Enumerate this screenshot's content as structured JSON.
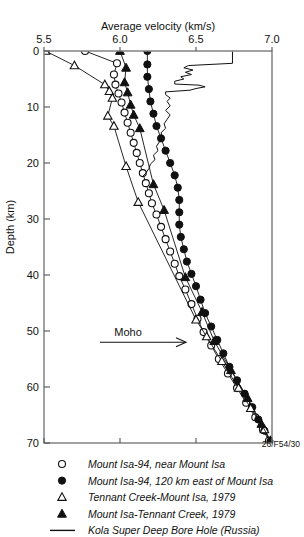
{
  "figure": {
    "code_label": "26/F54/30",
    "annotation": {
      "text": "Moho",
      "depth_km": 52
    }
  },
  "chart_data": {
    "type": "line",
    "title": "Average velocity (km/s)",
    "xlabel": "Average velocity (km/s)",
    "ylabel": "Depth (km)",
    "xlim": [
      5.5,
      7.0
    ],
    "ylim": [
      0,
      70
    ],
    "y_inverted": true,
    "xticks": [
      5.5,
      6.0,
      6.5,
      7.0
    ],
    "xtick_labels": [
      "5.5",
      "6.0",
      "6.5",
      "7.0"
    ],
    "yticks": [
      0,
      10,
      20,
      30,
      40,
      50,
      60,
      70
    ],
    "ytick_labels": [
      "0",
      "10",
      "20",
      "30",
      "40",
      "50",
      "60",
      "70"
    ],
    "grid": false,
    "legend_position": "below",
    "series": [
      {
        "name": "Mount Isa-94, near Mount Isa",
        "marker": "open-circle",
        "points": [
          [
            5.77,
            0.0
          ],
          [
            5.98,
            2.2
          ],
          [
            5.96,
            4.2
          ],
          [
            5.97,
            6.0
          ],
          [
            5.99,
            7.6
          ],
          [
            6.01,
            9.2
          ],
          [
            6.03,
            11.0
          ],
          [
            6.05,
            12.8
          ],
          [
            6.07,
            14.6
          ],
          [
            6.09,
            16.4
          ],
          [
            6.11,
            18.2
          ],
          [
            6.13,
            20.0
          ],
          [
            6.15,
            21.8
          ],
          [
            6.17,
            23.6
          ],
          [
            6.19,
            25.4
          ],
          [
            6.21,
            27.2
          ],
          [
            6.24,
            29.2
          ],
          [
            6.27,
            31.4
          ],
          [
            6.3,
            33.6
          ],
          [
            6.33,
            35.8
          ],
          [
            6.36,
            38.0
          ],
          [
            6.39,
            40.2
          ],
          [
            6.43,
            42.6
          ],
          [
            6.47,
            45.2
          ],
          [
            6.51,
            47.8
          ],
          [
            6.55,
            50.2
          ],
          [
            6.6,
            52.6
          ],
          [
            6.65,
            55.0
          ],
          [
            6.71,
            57.6
          ],
          [
            6.77,
            60.2
          ],
          [
            6.83,
            62.8
          ],
          [
            6.89,
            65.4
          ],
          [
            6.94,
            67.6
          ],
          [
            6.98,
            69.6
          ]
        ]
      },
      {
        "name": "Mount Isa-94, 120 km east of Mount Isa",
        "marker": "filled-circle",
        "points": [
          [
            6.18,
            0.0
          ],
          [
            6.18,
            2.4
          ],
          [
            6.18,
            4.6
          ],
          [
            6.19,
            6.8
          ],
          [
            6.2,
            9.0
          ],
          [
            6.22,
            11.2
          ],
          [
            6.24,
            13.4
          ],
          [
            6.27,
            15.6
          ],
          [
            6.3,
            17.8
          ],
          [
            6.33,
            20.0
          ],
          [
            6.36,
            22.2
          ],
          [
            6.38,
            24.4
          ],
          [
            6.39,
            26.6
          ],
          [
            6.39,
            28.8
          ],
          [
            6.39,
            31.0
          ],
          [
            6.4,
            33.2
          ],
          [
            6.42,
            35.4
          ],
          [
            6.44,
            37.6
          ],
          [
            6.47,
            39.8
          ],
          [
            6.5,
            42.0
          ],
          [
            6.53,
            44.4
          ],
          [
            6.56,
            46.8
          ],
          [
            6.6,
            49.2
          ],
          [
            6.64,
            51.6
          ],
          [
            6.68,
            54.0
          ],
          [
            6.72,
            56.4
          ],
          [
            6.77,
            58.8
          ],
          [
            6.82,
            61.2
          ],
          [
            6.87,
            63.6
          ],
          [
            6.91,
            65.8
          ],
          [
            6.95,
            67.8
          ],
          [
            6.99,
            69.7
          ]
        ]
      },
      {
        "name": "Tennant Creek-Mount Isa, 1979",
        "marker": "open-triangle",
        "points": [
          [
            5.51,
            0.0
          ],
          [
            5.7,
            2.6
          ],
          [
            5.9,
            6.0
          ],
          [
            5.93,
            7.2
          ],
          [
            5.95,
            8.4
          ],
          [
            5.92,
            11.6
          ],
          [
            5.96,
            13.4
          ],
          [
            6.04,
            20.6
          ],
          [
            6.12,
            27.0
          ],
          [
            6.5,
            48.0
          ],
          [
            6.57,
            51.0
          ],
          [
            6.67,
            55.4
          ],
          [
            6.78,
            60.2
          ],
          [
            6.86,
            63.8
          ],
          [
            6.95,
            67.6
          ],
          [
            6.99,
            69.6
          ]
        ]
      },
      {
        "name": "Mount Isa-Tennant Creek, 1979",
        "marker": "filled-triangle",
        "points": [
          [
            6.0,
            0.0
          ],
          [
            6.04,
            3.0
          ],
          [
            6.03,
            5.6
          ],
          [
            6.05,
            7.4
          ],
          [
            6.07,
            9.6
          ],
          [
            6.09,
            11.4
          ],
          [
            6.13,
            13.8
          ],
          [
            6.22,
            23.8
          ],
          [
            6.29,
            28.4
          ],
          [
            6.43,
            40.4
          ],
          [
            6.54,
            46.6
          ],
          [
            6.62,
            51.8
          ],
          [
            6.73,
            57.0
          ],
          [
            6.84,
            62.0
          ],
          [
            6.93,
            66.6
          ],
          [
            6.99,
            69.6
          ]
        ]
      },
      {
        "name": "Kola Super Deep Bore Hole (Russia)",
        "marker": "line",
        "points": [
          [
            6.74,
            0.0
          ],
          [
            6.74,
            2.2
          ],
          [
            6.45,
            2.6
          ],
          [
            6.42,
            3.0
          ],
          [
            6.48,
            3.4
          ],
          [
            6.43,
            3.8
          ],
          [
            6.47,
            4.2
          ],
          [
            6.4,
            4.6
          ],
          [
            6.42,
            5.0
          ],
          [
            6.36,
            5.4
          ],
          [
            6.36,
            5.9
          ],
          [
            6.52,
            6.1
          ],
          [
            6.56,
            6.4
          ],
          [
            6.5,
            6.7
          ],
          [
            6.46,
            7.0
          ],
          [
            6.3,
            7.3
          ],
          [
            6.3,
            7.8
          ],
          [
            6.33,
            8.4
          ],
          [
            6.31,
            9.0
          ],
          [
            6.33,
            9.8
          ],
          [
            6.3,
            10.6
          ],
          [
            6.33,
            11.4
          ],
          [
            6.31,
            12.2
          ],
          [
            6.29,
            13.0
          ],
          [
            6.3,
            13.8
          ],
          [
            6.27,
            14.6
          ],
          [
            6.28,
            15.4
          ],
          [
            6.26,
            16.2
          ],
          [
            6.24,
            17.0
          ],
          [
            6.25,
            17.8
          ],
          [
            6.22,
            18.6
          ],
          [
            6.23,
            19.4
          ],
          [
            6.2,
            20.2
          ],
          [
            6.19,
            21.0
          ],
          [
            6.17,
            21.8
          ],
          [
            6.15,
            22.4
          ]
        ]
      }
    ]
  },
  "legend": {
    "items": [
      {
        "marker": "open-circle",
        "label": "Mount Isa-94, near Mount Isa"
      },
      {
        "marker": "filled-circle",
        "label": "Mount Isa-94, 120 km east of Mount Isa"
      },
      {
        "marker": "open-triangle",
        "label": "Tennant Creek-Mount Isa, 1979"
      },
      {
        "marker": "filled-triangle",
        "label": "Mount Isa-Tennant Creek, 1979"
      },
      {
        "marker": "line",
        "label": "Kola Super Deep Bore Hole (Russia)"
      }
    ]
  },
  "colors": {
    "ink": "#111111",
    "axis": "#555555",
    "background": "#ffffff"
  }
}
